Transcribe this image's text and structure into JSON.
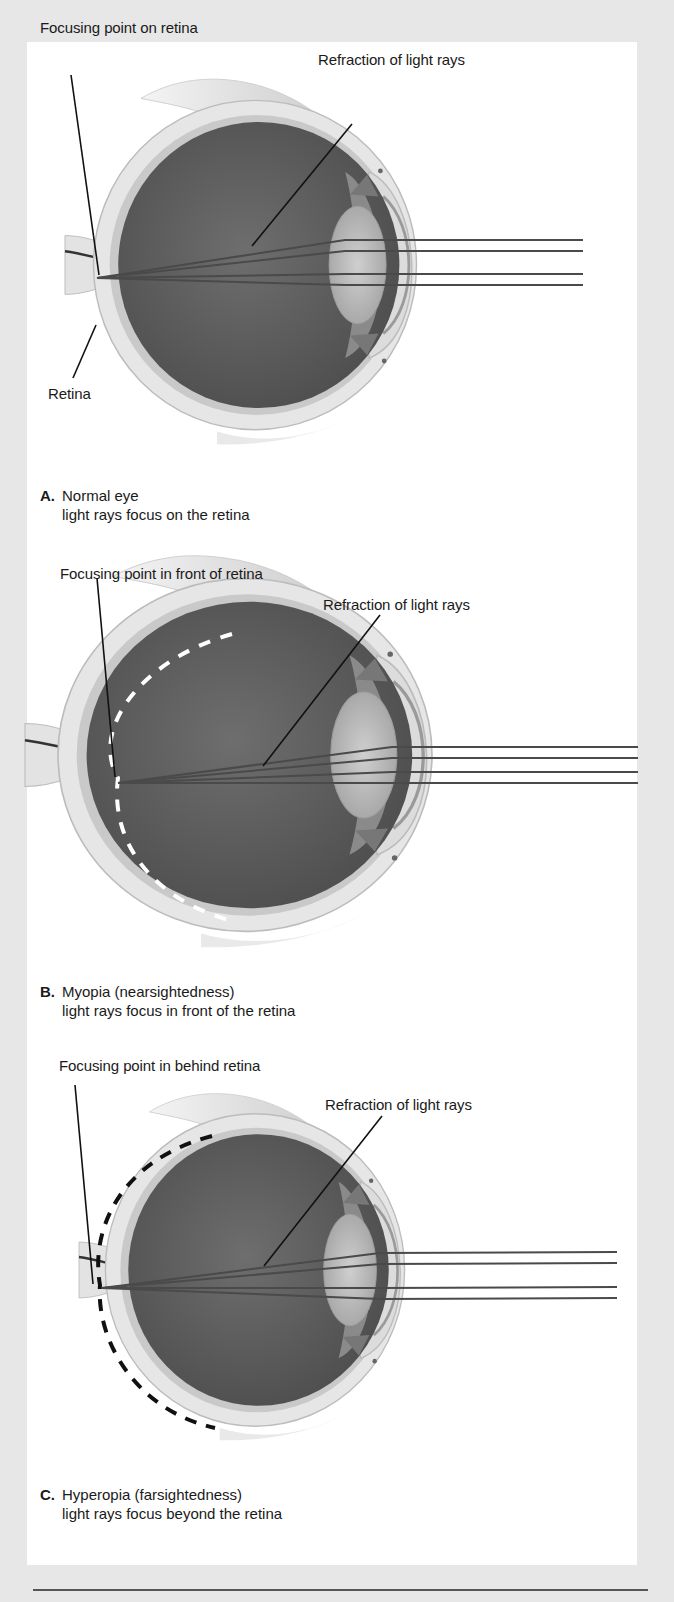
{
  "figure": {
    "panels": [
      {
        "id": "A",
        "letter": "A.",
        "title": "Normal eye",
        "subtitle": "light rays focus on the retina",
        "labels": {
          "focus": "Focusing point on retina",
          "refraction": "Refraction of light rays",
          "retina": "Retina"
        },
        "retina_marker": "none"
      },
      {
        "id": "B",
        "letter": "B.",
        "title": "Myopia (nearsightedness)",
        "subtitle": "light rays focus in front of the retina",
        "labels": {
          "focus": "Focusing point in front of retina",
          "refraction": "Refraction of light rays"
        },
        "retina_marker": "white-dashed-arc"
      },
      {
        "id": "C",
        "letter": "C.",
        "title": "Hyperopia (farsightedness)",
        "subtitle": "light rays focus beyond the retina",
        "labels": {
          "focus": "Focusing point in behind retina",
          "refraction": "Refraction of light rays"
        },
        "retina_marker": "black-dashed-arc"
      }
    ],
    "colors": {
      "background": "#e7e7e7",
      "panel": "#ffffff",
      "eye_interior": "#5e5e5e",
      "sclera": "#d9d9d9",
      "lens": "#c9c9c9",
      "ray": "#4a4a4a",
      "leader_line": "#111111"
    }
  }
}
